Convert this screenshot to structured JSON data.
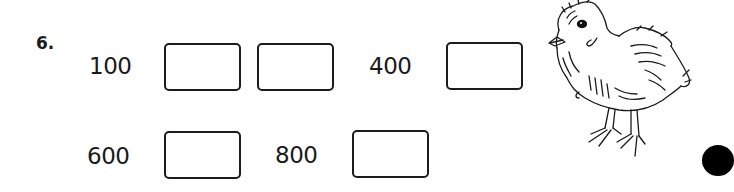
{
  "exercise": {
    "number": "6.",
    "rows": [
      {
        "items": [
          {
            "type": "number",
            "value": "100"
          },
          {
            "type": "blank"
          },
          {
            "type": "blank"
          },
          {
            "type": "number",
            "value": "400"
          },
          {
            "type": "blank"
          }
        ]
      },
      {
        "items": [
          {
            "type": "number",
            "value": "600"
          },
          {
            "type": "blank"
          },
          {
            "type": "number",
            "value": "800"
          },
          {
            "type": "blank"
          }
        ]
      }
    ]
  },
  "illustration": {
    "icon": "chick-illustration",
    "description": "Line drawing of a baby chick"
  },
  "decorations": {
    "dot": "black-circle-marker",
    "dot_color": "#000000"
  }
}
